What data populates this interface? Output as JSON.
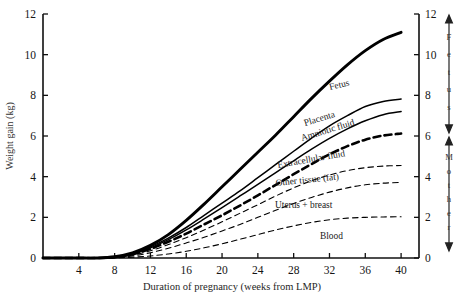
{
  "chart_data": {
    "type": "line",
    "title": "",
    "xlabel": "Duration of pregnancy (weeks from LMP)",
    "ylabel": "Weight gain (kg)",
    "xlim": [
      0,
      42
    ],
    "ylim": [
      0,
      12
    ],
    "xticks": [
      4,
      8,
      12,
      16,
      20,
      24,
      28,
      32,
      36,
      40
    ],
    "yticks": [
      0,
      2,
      4,
      6,
      8,
      10,
      12
    ],
    "yticks_right": [
      0,
      2,
      4,
      6,
      8,
      10,
      12
    ],
    "grid": false,
    "legend": "inline-curve-labels",
    "x": [
      0,
      2,
      4,
      6,
      8,
      10,
      12,
      14,
      16,
      18,
      20,
      22,
      24,
      26,
      28,
      30,
      32,
      34,
      36,
      38,
      40
    ],
    "series": [
      {
        "name": "Fetus",
        "label": "Fetus",
        "style": "solid-thick",
        "values": [
          0,
          0,
          0,
          0,
          0.06,
          0.25,
          0.62,
          1.15,
          1.85,
          2.65,
          3.5,
          4.35,
          5.2,
          6.05,
          6.95,
          7.85,
          8.7,
          9.5,
          10.2,
          10.75,
          11.1
        ]
      },
      {
        "name": "Placenta",
        "label": "Placenta",
        "style": "solid-med",
        "values": [
          0,
          0,
          0,
          0,
          0.05,
          0.22,
          0.55,
          0.98,
          1.5,
          2.1,
          2.7,
          3.3,
          3.95,
          4.6,
          5.25,
          5.9,
          6.5,
          7.0,
          7.45,
          7.7,
          7.82
        ]
      },
      {
        "name": "Amniotic fluid",
        "label": "Amniotic fluid",
        "style": "solid-med",
        "values": [
          0,
          0,
          0,
          0,
          0.05,
          0.2,
          0.5,
          0.9,
          1.38,
          1.92,
          2.48,
          3.05,
          3.62,
          4.2,
          4.78,
          5.35,
          5.88,
          6.35,
          6.75,
          7.05,
          7.2
        ]
      },
      {
        "name": "Extracellular fluid",
        "label": "Extracellular fluid",
        "style": "dashed-thick",
        "values": [
          0,
          0,
          0,
          0,
          0.04,
          0.18,
          0.45,
          0.8,
          1.2,
          1.65,
          2.1,
          2.58,
          3.08,
          3.6,
          4.12,
          4.62,
          5.1,
          5.5,
          5.82,
          6.02,
          6.12
        ]
      },
      {
        "name": "Other tissue (fat)",
        "label": "Other tissue (fat)",
        "style": "dashed-thin",
        "values": [
          0,
          0,
          0,
          0,
          0.03,
          0.14,
          0.36,
          0.66,
          1.0,
          1.38,
          1.78,
          2.2,
          2.62,
          3.05,
          3.45,
          3.8,
          4.08,
          4.3,
          4.44,
          4.52,
          4.55
        ]
      },
      {
        "name": "Uterus + breast",
        "label": "Uterus + breast",
        "style": "dashed-thin",
        "values": [
          0,
          0,
          0,
          0,
          0.02,
          0.1,
          0.26,
          0.48,
          0.74,
          1.02,
          1.33,
          1.65,
          2.0,
          2.35,
          2.68,
          2.98,
          3.24,
          3.45,
          3.6,
          3.68,
          3.72
        ]
      },
      {
        "name": "Blood",
        "label": "Blood",
        "style": "dashed-thin",
        "values": [
          0,
          0,
          0,
          0,
          0.01,
          0.04,
          0.1,
          0.2,
          0.33,
          0.5,
          0.7,
          0.92,
          1.15,
          1.38,
          1.58,
          1.75,
          1.88,
          1.96,
          2.0,
          2.02,
          2.03
        ]
      }
    ],
    "curve_labels": [
      {
        "text": "Fetus",
        "x": 330,
        "y": 90,
        "rotate": -13
      },
      {
        "text": "Placenta",
        "x": 305,
        "y": 126,
        "rotate": -17
      },
      {
        "text": "Amniotic fluid",
        "x": 302,
        "y": 141,
        "rotate": -17
      },
      {
        "text": "Extracellular fluid",
        "x": 278,
        "y": 168,
        "rotate": -10
      },
      {
        "text": "Other tissue (fat)",
        "x": 276,
        "y": 186,
        "rotate": -6
      },
      {
        "text": "Uterus + breast",
        "x": 275,
        "y": 208,
        "rotate": 0
      },
      {
        "text": "Blood",
        "x": 320,
        "y": 239,
        "rotate": 0
      }
    ],
    "side_groups": [
      {
        "name": "Fetus",
        "letters": [
          "F",
          "e",
          "t",
          "u",
          "s"
        ],
        "top_value": 12.0,
        "bottom_value": 6.1
      },
      {
        "name": "Mother",
        "letters": [
          "M",
          "o",
          "t",
          "h",
          "e",
          "r"
        ],
        "top_value": 6.0,
        "bottom_value": 0.3
      }
    ]
  }
}
